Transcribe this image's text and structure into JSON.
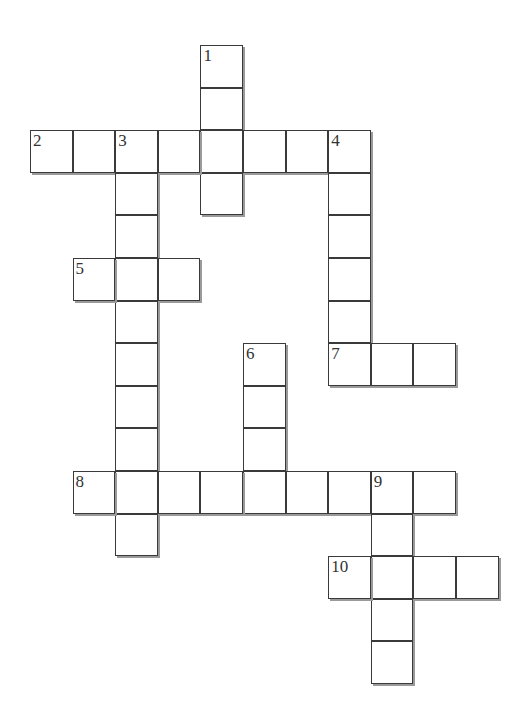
{
  "puzzle": {
    "origin": {
      "x": 30,
      "y": 45
    },
    "cell_size": 42.6,
    "entries": [
      {
        "number": 1,
        "direction": "down",
        "row": 0,
        "col": 4,
        "length": 4
      },
      {
        "number": 2,
        "direction": "across",
        "row": 2,
        "col": 0,
        "length": 8
      },
      {
        "number": 3,
        "direction": "down",
        "row": 2,
        "col": 2,
        "length": 10
      },
      {
        "number": 4,
        "direction": "down",
        "row": 2,
        "col": 7,
        "length": 6
      },
      {
        "number": 5,
        "direction": "across",
        "row": 5,
        "col": 1,
        "length": 3
      },
      {
        "number": 6,
        "direction": "down",
        "row": 7,
        "col": 5,
        "length": 4
      },
      {
        "number": 7,
        "direction": "across",
        "row": 7,
        "col": 7,
        "length": 3
      },
      {
        "number": 8,
        "direction": "across",
        "row": 10,
        "col": 1,
        "length": 9
      },
      {
        "number": 9,
        "direction": "down",
        "row": 10,
        "col": 8,
        "length": 5
      },
      {
        "number": 10,
        "direction": "across",
        "row": 12,
        "col": 7,
        "length": 4
      }
    ]
  }
}
